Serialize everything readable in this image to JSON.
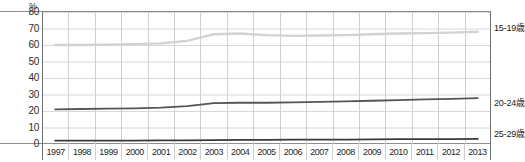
{
  "chart_data": {
    "type": "line",
    "title": "",
    "subtitle": "",
    "xlabel": "",
    "ylabel": "%",
    "unit": "%",
    "categories": [
      "1997",
      "1998",
      "1999",
      "2000",
      "2001",
      "2002",
      "2003",
      "2004",
      "2005",
      "2006",
      "2007",
      "2008",
      "2009",
      "2010",
      "2011",
      "2012",
      "2013"
    ],
    "ylim": [
      0,
      80
    ],
    "yticks": [
      80,
      70,
      60,
      50,
      40,
      30,
      20,
      10,
      0
    ],
    "grid": true,
    "legend_position": "right-inline",
    "series": [
      {
        "name": "15-19歳",
        "color": "#d2d2d2",
        "values": [
          60.0,
          60.0,
          60.2,
          60.5,
          61.0,
          62.5,
          66.5,
          67.0,
          66.0,
          65.5,
          65.8,
          66.0,
          66.5,
          67.0,
          67.2,
          67.5,
          68.0
        ]
      },
      {
        "name": "20-24歳",
        "color": "#555555",
        "values": [
          21.0,
          21.2,
          21.4,
          21.6,
          22.0,
          23.0,
          24.8,
          25.0,
          25.0,
          25.2,
          25.5,
          25.8,
          26.2,
          26.6,
          27.0,
          27.4,
          27.8
        ]
      },
      {
        "name": "25-29歳",
        "color": "#3a3a3a",
        "values": [
          2.0,
          2.0,
          2.1,
          2.1,
          2.2,
          2.2,
          2.4,
          2.5,
          2.5,
          2.6,
          2.6,
          2.7,
          2.8,
          2.9,
          3.0,
          3.0,
          3.1
        ]
      }
    ],
    "series_labels": [
      {
        "text": "15-19歳",
        "top": 24
      },
      {
        "text": "20-24歳",
        "top": 99
      },
      {
        "text": "25-29歳",
        "top": 130
      }
    ]
  }
}
